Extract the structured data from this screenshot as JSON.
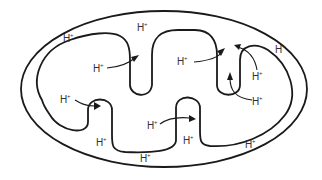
{
  "diagram": {
    "ion_label": "H",
    "ion_charge": "+",
    "labels": [
      {
        "id": "outer-top-left",
        "text": "H",
        "sup": "+"
      },
      {
        "id": "intermembrane-top",
        "text": "H",
        "sup": "+"
      },
      {
        "id": "matrix-upper-left",
        "text": "H",
        "sup": "+"
      },
      {
        "id": "matrix-upper-mid",
        "text": "H",
        "sup": "+"
      },
      {
        "id": "outer-top-right",
        "text": "H",
        "sup": "+"
      },
      {
        "id": "matrix-right-upper",
        "text": "H",
        "sup": "+"
      },
      {
        "id": "matrix-right-lower",
        "text": "H",
        "sup": "+"
      },
      {
        "id": "matrix-left",
        "text": "H",
        "sup": "+"
      },
      {
        "id": "matrix-center",
        "text": "H",
        "sup": "+"
      },
      {
        "id": "crista-bottom-left",
        "text": "H",
        "sup": "+"
      },
      {
        "id": "crista-bottom-mid",
        "text": "H",
        "sup": "+"
      },
      {
        "id": "outer-bottom-mid",
        "text": "H",
        "sup": "+"
      },
      {
        "id": "outer-bottom-right",
        "text": "H",
        "sup": "+"
      }
    ],
    "colors": {
      "line": "#1a1a1a",
      "text": "#333333",
      "background": "#ffffff"
    }
  }
}
